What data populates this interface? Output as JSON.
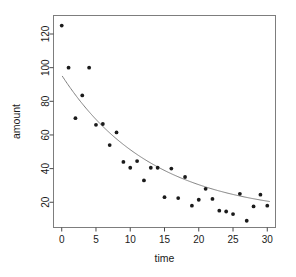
{
  "chart_data": {
    "type": "scatter",
    "title": "",
    "xlabel": "time",
    "ylabel": "amount",
    "xlim": [
      -1.2,
      31.2
    ],
    "ylim": [
      5,
      131
    ],
    "grid": false,
    "legend": null,
    "xticks": [
      0,
      5,
      10,
      15,
      20,
      25,
      30
    ],
    "yticks": [
      20,
      40,
      60,
      80,
      100,
      120
    ],
    "xtick_labels": [
      "0",
      "5",
      "10",
      "15",
      "20",
      "25",
      "30"
    ],
    "ytick_labels": [
      "20",
      "40",
      "60",
      "80",
      "100",
      "120"
    ],
    "point_color": "#1a1a1a",
    "curve_color": "#808080",
    "frame_color": "#7d7d7d",
    "series": [
      {
        "name": "observations",
        "marker": "filled-circle",
        "x": [
          0,
          1,
          2,
          3,
          4,
          5,
          6,
          7,
          8,
          9,
          10,
          11,
          12,
          13,
          14,
          15,
          16,
          17,
          18,
          19,
          20,
          21,
          22,
          23,
          24,
          25,
          26,
          27,
          28,
          29,
          30
        ],
        "y": [
          125,
          100,
          70,
          83.5,
          100,
          66,
          66.5,
          54,
          61.5,
          44,
          40.5,
          44.5,
          33,
          40.5,
          40.5,
          23,
          40,
          22.5,
          35,
          18,
          21.5,
          28,
          22,
          15,
          14.5,
          13,
          25,
          9,
          17.5,
          24.5,
          18
        ]
      }
    ],
    "fit_curve": {
      "name": "exponential-decay-fit",
      "model": "y = a * exp(-b * x) + c",
      "a": 83.5,
      "b": 0.0755,
      "c": 12.0,
      "x_start": 0.1,
      "x_end": 30.3
    }
  },
  "labels": {
    "x_axis_title": "time",
    "y_axis_title": "amount"
  }
}
